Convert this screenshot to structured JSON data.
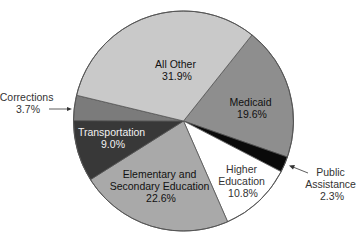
{
  "chart_data": {
    "type": "pie",
    "title": "",
    "start_angle_deg": 38.5,
    "direction": "clockwise",
    "legend": "none",
    "slices": [
      {
        "label": "Medicaid",
        "value": 19.6,
        "color": "#8e8e8e",
        "text_color": "#111111"
      },
      {
        "label": "Public Assistance",
        "value": 2.3,
        "color": "#0a0a0a",
        "text_color": "#333333"
      },
      {
        "label": "Higher Education",
        "value": 10.8,
        "color": "#ffffff",
        "text_color": "#333333"
      },
      {
        "label": "Elementary and Secondary Education",
        "value": 22.6,
        "color": "#a9a9a9",
        "text_color": "#111111"
      },
      {
        "label": "Transportation",
        "value": 9.0,
        "color": "#383838",
        "text_color": "#f2f2f2"
      },
      {
        "label": "Corrections",
        "value": 3.7,
        "color": "#7b7b7b",
        "text_color": "#333333"
      },
      {
        "label": "All Other",
        "value": 31.9,
        "color": "#c9c9c9",
        "text_color": "#111111"
      }
    ]
  },
  "labels": {
    "medicaid": {
      "name": "Medicaid",
      "pct": "19.6%"
    },
    "public_assistance": {
      "line1": "Public",
      "line2": "Assistance",
      "pct": "2.3%"
    },
    "higher_education": {
      "line1": "Higher",
      "line2": "Education",
      "pct": "10.8%"
    },
    "elementary": {
      "line1": "Elementary and",
      "line2": "Secondary Education",
      "pct": "22.6%"
    },
    "transportation": {
      "name": "Transportation",
      "pct": "9.0%"
    },
    "corrections": {
      "name": "Corrections",
      "pct": "3.7%"
    },
    "all_other": {
      "name": "All Other",
      "pct": "31.9%"
    }
  }
}
